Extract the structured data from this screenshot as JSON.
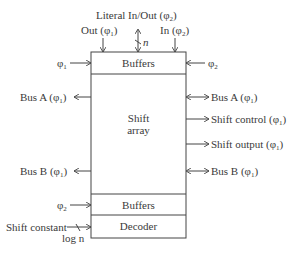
{
  "diagram": {
    "top_labels": {
      "literal": "Literal In/Out (φ",
      "literal_sub": "2",
      "out": "Out (φ",
      "out_sub": "1",
      "in": "In (φ",
      "in_sub": "2",
      "width_n": "n"
    },
    "clock_inputs": {
      "top_left": "φ",
      "top_left_sub": "1",
      "top_right": "φ",
      "top_right_sub": "2",
      "bottom_left": "φ",
      "bottom_left_sub": "2"
    },
    "blocks": {
      "top_buffers": "Buffers",
      "shift_array_line1": "Shift",
      "shift_array_line2": "array",
      "bottom_buffers": "Buffers",
      "decoder": "Decoder"
    },
    "left_ports": {
      "bus_a": "Bus A (φ",
      "bus_a_sub": "1",
      "bus_b": "Bus B (φ",
      "bus_b_sub": "1",
      "shift_constant": "Shift constant",
      "log_n": "log n"
    },
    "right_ports": {
      "bus_a": "Bus A (φ",
      "bus_a_sub": "1",
      "shift_control": "Shift control (φ",
      "shift_control_sub": "1",
      "shift_output": "Shift output (φ",
      "shift_output_sub": "1",
      "bus_b": "Bus B (φ",
      "bus_b_sub": "1"
    },
    "close_paren": ")"
  }
}
